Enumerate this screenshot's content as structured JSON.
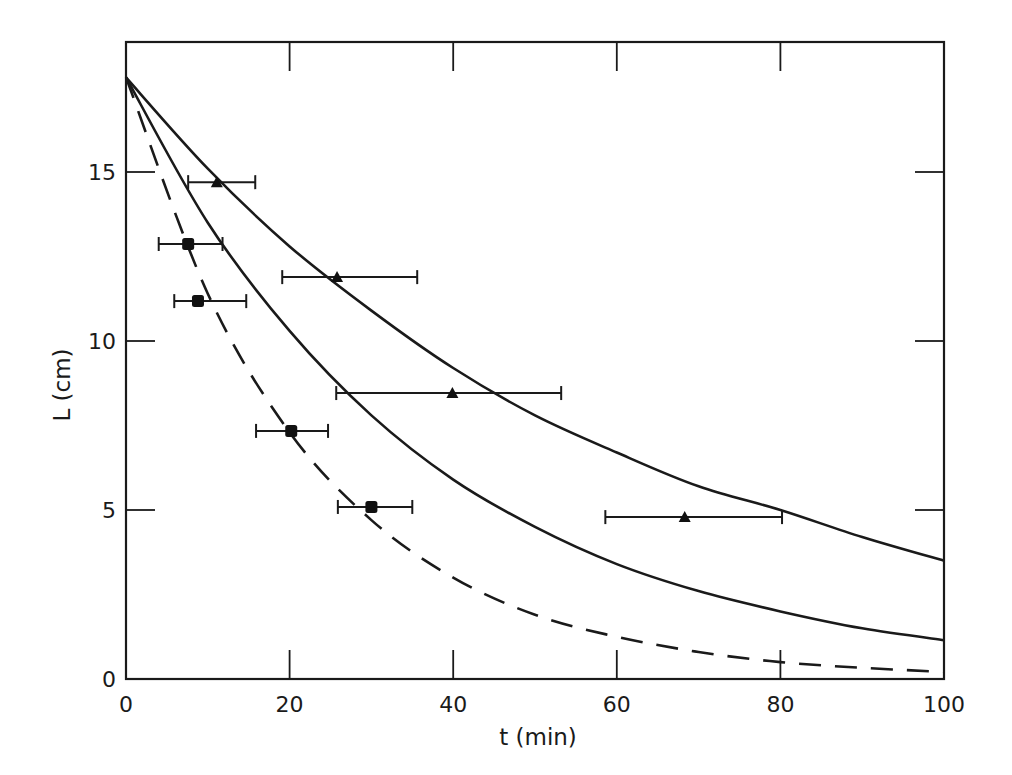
{
  "chart_data": {
    "type": "line",
    "title": "",
    "xlabel": "t (min)",
    "ylabel": "L (cm)",
    "xlim": [
      0,
      100
    ],
    "ylim": [
      0,
      18.9
    ],
    "x_ticks": [
      0,
      20,
      40,
      60,
      80,
      100
    ],
    "x_tick_labels": [
      "0",
      "20",
      "40",
      "60",
      "80",
      "100"
    ],
    "y_ticks": [
      0,
      5,
      10,
      15
    ],
    "y_tick_labels": [
      "0",
      "5",
      "10",
      "15"
    ],
    "grid": false,
    "legend": null,
    "series": [
      {
        "name": "upper solid curve",
        "style": "solid",
        "x": [
          0,
          10,
          20,
          30,
          40,
          50,
          60,
          70,
          80,
          90,
          100
        ],
        "values": [
          17.8,
          15.1,
          12.8,
          10.9,
          9.2,
          7.8,
          6.7,
          5.7,
          5.0,
          4.2,
          3.5
        ]
      },
      {
        "name": "middle solid curve",
        "style": "solid",
        "x": [
          0,
          10,
          20,
          30,
          40,
          50,
          60,
          70,
          80,
          90,
          100
        ],
        "values": [
          17.8,
          13.5,
          10.3,
          7.8,
          5.9,
          4.5,
          3.4,
          2.6,
          2.0,
          1.5,
          1.15
        ]
      },
      {
        "name": "dashed curve",
        "style": "dashed",
        "x": [
          0,
          10,
          20,
          30,
          40,
          50,
          60,
          70,
          80,
          90,
          100
        ],
        "values": [
          17.8,
          11.4,
          7.3,
          4.7,
          3.0,
          1.9,
          1.25,
          0.8,
          0.5,
          0.33,
          0.21
        ]
      },
      {
        "name": "squares",
        "style": "marker-square",
        "x": [
          7.6,
          8.8,
          20.2,
          30.0
        ],
        "values": [
          12.87,
          11.18,
          7.34,
          5.09
        ],
        "x_err_low": [
          4.0,
          5.9,
          15.9,
          25.9
        ],
        "x_err_high": [
          11.8,
          14.7,
          24.7,
          35.0
        ]
      },
      {
        "name": "triangles",
        "style": "marker-triangle",
        "x": [
          11.1,
          25.8,
          39.9,
          68.3
        ],
        "values": [
          14.7,
          11.89,
          8.46,
          4.79
        ],
        "x_err_low": [
          7.6,
          19.1,
          25.7,
          58.6
        ],
        "x_err_high": [
          15.8,
          35.6,
          53.2,
          80.2
        ]
      }
    ]
  }
}
